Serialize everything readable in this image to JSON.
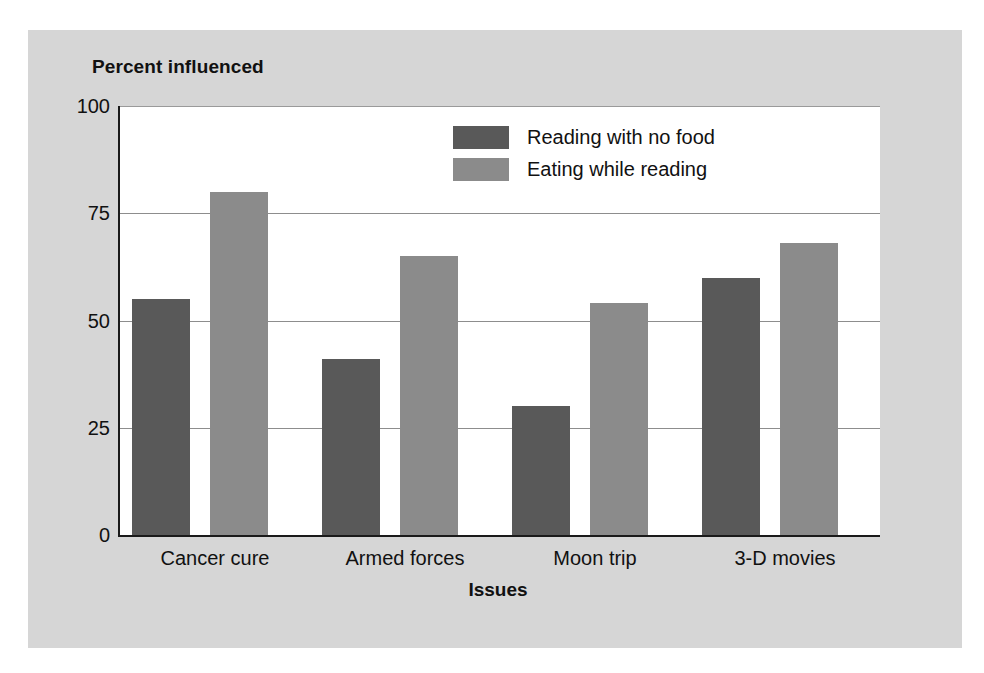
{
  "chart_data": {
    "type": "bar",
    "title": "",
    "ylabel": "Percent influenced",
    "xlabel": "Issues",
    "categories": [
      "Cancer cure",
      "Armed forces",
      "Moon trip",
      "3-D movies"
    ],
    "series": [
      {
        "name": "Reading with no food",
        "color": "#595959",
        "values": [
          55,
          41,
          30,
          60
        ]
      },
      {
        "name": "Eating while reading",
        "color": "#8b8b8b",
        "values": [
          80,
          65,
          54,
          68
        ]
      }
    ],
    "ylim": [
      0,
      100
    ],
    "yticks": [
      0,
      25,
      50,
      75,
      100
    ],
    "ytick_labels": [
      "0",
      "25",
      "50",
      "75",
      "100"
    ],
    "grid": true,
    "legend_position": "inside-top-right"
  }
}
